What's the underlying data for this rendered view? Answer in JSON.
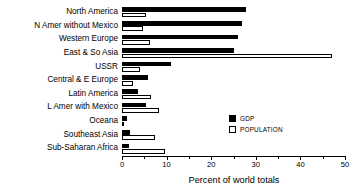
{
  "chart_data": {
    "type": "bar",
    "orientation": "horizontal",
    "title": "",
    "xlabel": "Percent of world totals",
    "ylabel": "",
    "xlim": [
      0,
      50
    ],
    "xticks": [
      0,
      10,
      20,
      30,
      40,
      50
    ],
    "xtick_labels": [
      "0",
      "10",
      "20",
      "30",
      "40",
      "50"
    ],
    "minor_xticks": [
      5,
      15,
      25,
      35,
      45
    ],
    "grid": false,
    "legend_position": "inside-right",
    "categories": [
      "North America",
      "N Amer without Mexico",
      "Western Europe",
      "East & So Asia",
      "USSR",
      "Central & E Europe",
      "Latin America",
      "L Amer with Mexico",
      "Oceana",
      "Southeast Asia",
      "Sub-Saharan Africa"
    ],
    "series": [
      {
        "name": "GDP",
        "color": "#000000",
        "values": [
          27.8,
          26.9,
          26.0,
          25.0,
          11.0,
          5.8,
          3.6,
          5.3,
          1.2,
          1.9,
          1.6
        ]
      },
      {
        "name": "POPULATION",
        "color": "#ffffff",
        "values": [
          5.3,
          4.6,
          6.3,
          47.0,
          4.0,
          2.4,
          6.6,
          8.4,
          0.5,
          7.5,
          9.7
        ]
      }
    ]
  },
  "legend": {
    "items": [
      {
        "label": "GDP",
        "swatch": "filled"
      },
      {
        "label": "POPULATION",
        "swatch": "open"
      }
    ]
  }
}
